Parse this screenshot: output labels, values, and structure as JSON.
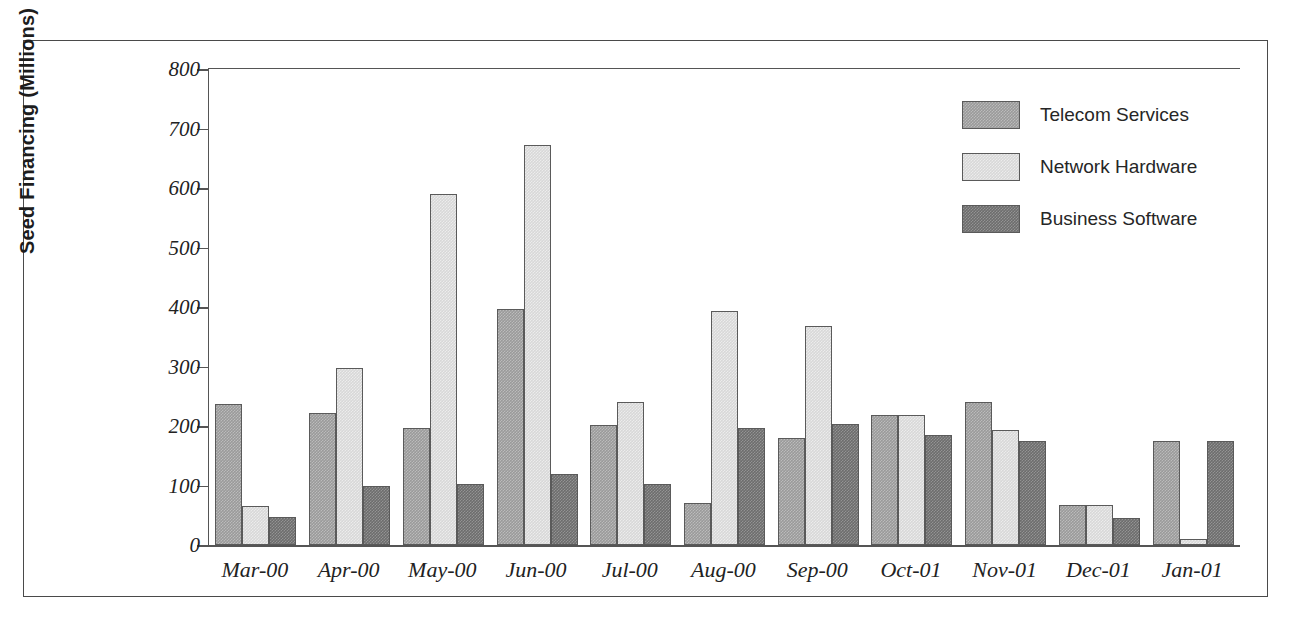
{
  "chart_data": {
    "type": "bar",
    "title": "",
    "xlabel": "",
    "ylabel": "Seed Financing (Millions)",
    "ylim": [
      0,
      800
    ],
    "yticks": [
      0,
      100,
      200,
      300,
      400,
      500,
      600,
      700,
      800
    ],
    "ytick_labels": [
      "0",
      "100",
      "200",
      "300",
      "400",
      "500",
      "600",
      "700",
      "800"
    ],
    "grid": false,
    "legend_position": "top-right",
    "categories": [
      "Mar-00",
      "Apr-00",
      "May-00",
      "Jun-00",
      "Jul-00",
      "Aug-00",
      "Sep-00",
      "Oct-01",
      "Nov-01",
      "Dec-01",
      "Jan-01"
    ],
    "series": [
      {
        "name": "Telecom Services",
        "color": "#9a9a9a",
        "values": [
          237,
          222,
          197,
          396,
          201,
          70,
          180,
          218,
          240,
          68,
          175
        ]
      },
      {
        "name": "Network Hardware",
        "color": "#d8d8d8",
        "values": [
          65,
          297,
          590,
          672,
          241,
          394,
          368,
          218,
          193,
          68,
          10
        ]
      },
      {
        "name": "Business Software",
        "color": "#6d6d6d",
        "values": [
          47,
          99,
          103,
          120,
          102,
          197,
          204,
          185,
          175,
          45,
          175
        ]
      }
    ]
  },
  "legend": {
    "entries": [
      {
        "label": "Telecom Services"
      },
      {
        "label": "Network Hardware"
      },
      {
        "label": "Business Software"
      }
    ]
  }
}
